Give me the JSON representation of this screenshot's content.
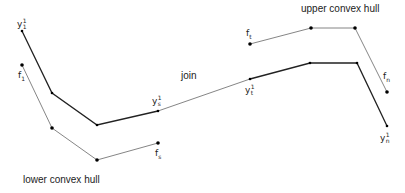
{
  "labels": {
    "upper_hull": "upper convex hull",
    "lower_hull": "lower convex hull",
    "join": "join"
  },
  "symbols": {
    "y1": {
      "base": "y",
      "sup": "1",
      "sub": "1"
    },
    "f1": {
      "base": "f",
      "sub": "1"
    },
    "ys": {
      "base": "y",
      "sup": "1",
      "sub": "s"
    },
    "fs": {
      "base": "f",
      "sub": "s"
    },
    "yt": {
      "base": "y",
      "sup": "1",
      "sub": "t"
    },
    "ft": {
      "base": "f",
      "sub": "t"
    },
    "fn": {
      "base": "f",
      "sub": "n"
    },
    "yn": {
      "base": "y",
      "sup": "1",
      "sub": "n"
    }
  },
  "colors": {
    "thick_line": "#222222",
    "thin_line": "#666666",
    "point": "#000000"
  },
  "curves": {
    "y_lower": [
      [
        22,
        31
      ],
      [
        52,
        93
      ],
      [
        97,
        125
      ],
      [
        158,
        111
      ]
    ],
    "join": [
      [
        158,
        111
      ],
      [
        250,
        79
      ]
    ],
    "y_upper": [
      [
        250,
        79
      ],
      [
        310,
        63
      ],
      [
        357,
        63
      ],
      [
        387,
        126
      ]
    ],
    "f_lower": [
      [
        22,
        65
      ],
      [
        52,
        128
      ],
      [
        97,
        160
      ],
      [
        158,
        143
      ]
    ],
    "f_upper": [
      [
        250,
        44
      ],
      [
        311,
        28
      ],
      [
        355,
        28
      ],
      [
        387,
        92
      ]
    ]
  }
}
